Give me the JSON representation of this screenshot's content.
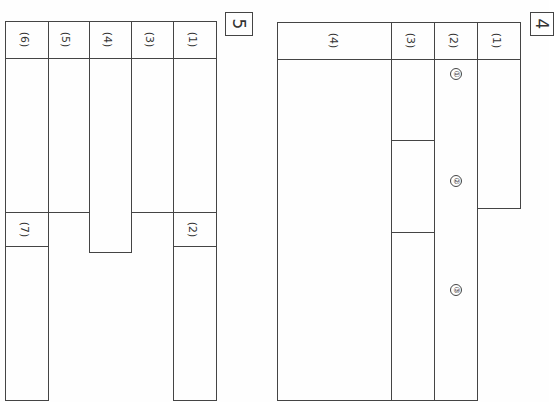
{
  "document": {
    "type": "answer-sheet",
    "orientation": "rotated-90"
  },
  "section5": {
    "tag": "5",
    "columns": [
      {
        "id": "q6",
        "label": "(6)"
      },
      {
        "id": "q5",
        "label": "(5)"
      },
      {
        "id": "q4",
        "label": "(4)"
      },
      {
        "id": "q3",
        "label": "(3)"
      },
      {
        "id": "q1",
        "label": "(1)"
      }
    ],
    "sub_labels": {
      "q7": "(7)",
      "q2": "(2)"
    }
  },
  "section4": {
    "tag": "4",
    "columns": [
      {
        "id": "q4",
        "label": "(4)"
      },
      {
        "id": "q3",
        "label": "(3)"
      },
      {
        "id": "q2",
        "label": "(2)"
      },
      {
        "id": "q1",
        "label": "(1)"
      }
    ],
    "markers": [
      "①",
      "②",
      "③"
    ]
  },
  "colors": {
    "line": "#444444",
    "paper": "#fefefe",
    "text": "#333333"
  }
}
